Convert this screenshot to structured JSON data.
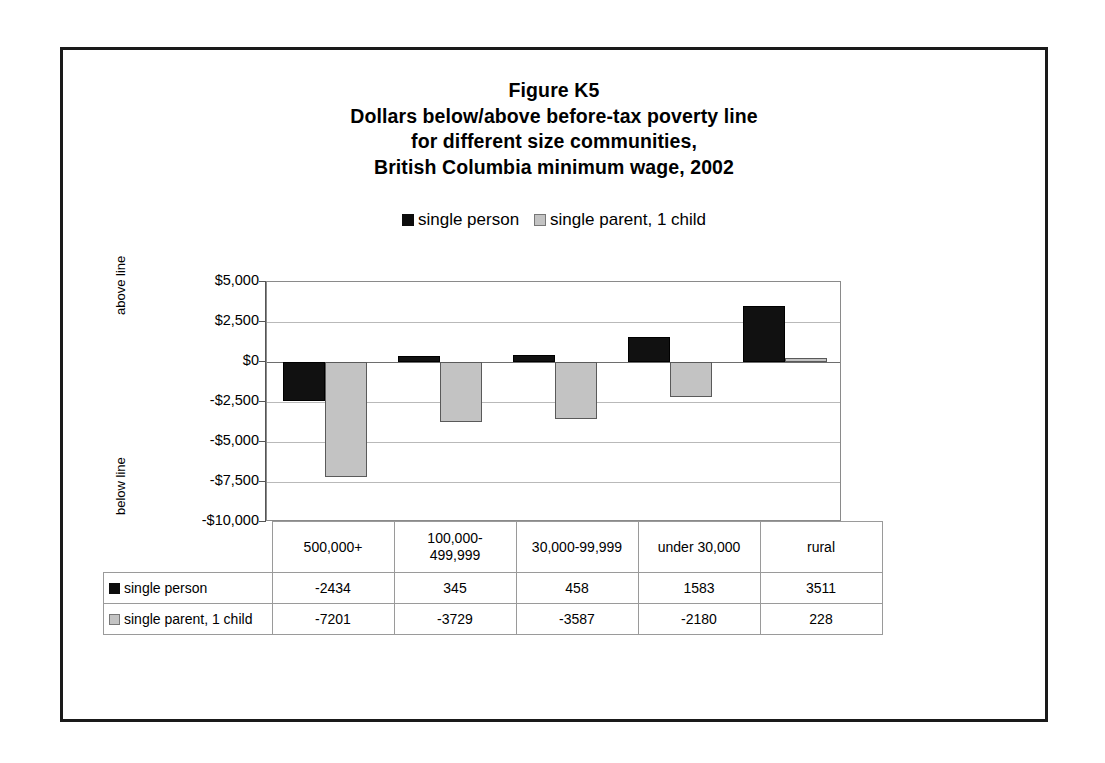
{
  "figure": {
    "title_lines": [
      "Figure K5",
      "Dollars below/above before-tax poverty line",
      "for different size communities,",
      "British Columbia minimum wage, 2002"
    ],
    "axis_captions": {
      "above": "above line",
      "below": "below line"
    },
    "colors": {
      "series_0": "#111111",
      "series_1": "#c3c3c3",
      "frame": "#1a1a1a",
      "gridline": "#b9b9b9",
      "zero_line": "#6e6e6e"
    }
  },
  "chart_data": {
    "type": "bar",
    "xlabel": "",
    "ylabel": "",
    "ylim": [
      -10000,
      5000
    ],
    "ytick_step": 2500,
    "ytick_labels": [
      "$5,000",
      "$2,500",
      "$0",
      "-$2,500",
      "-$5,000",
      "-$7,500",
      "-$10,000"
    ],
    "ytick_values": [
      5000,
      2500,
      0,
      -2500,
      -5000,
      -7500,
      -10000
    ],
    "grid": true,
    "legend_position": "top",
    "categories": [
      "500,000+",
      "100,000-499,999",
      "30,000-99,999",
      "under 30,000",
      "rural"
    ],
    "series": [
      {
        "name": "single person",
        "values": [
          -2434,
          345,
          458,
          1583,
          3511
        ]
      },
      {
        "name": "single parent, 1 child",
        "values": [
          -7201,
          -3729,
          -3587,
          -2180,
          228
        ]
      }
    ]
  },
  "data_table": {
    "category_row": [
      "500,000+",
      "100,000-\n499,999",
      "30,000-99,999",
      "under 30,000",
      "rural"
    ],
    "rows": [
      {
        "label": "single person",
        "values": [
          "-2434",
          "345",
          "458",
          "1583",
          "3511"
        ]
      },
      {
        "label": "single parent, 1 child",
        "values": [
          "-7201",
          "-3729",
          "-3587",
          "-2180",
          "228"
        ]
      }
    ]
  }
}
